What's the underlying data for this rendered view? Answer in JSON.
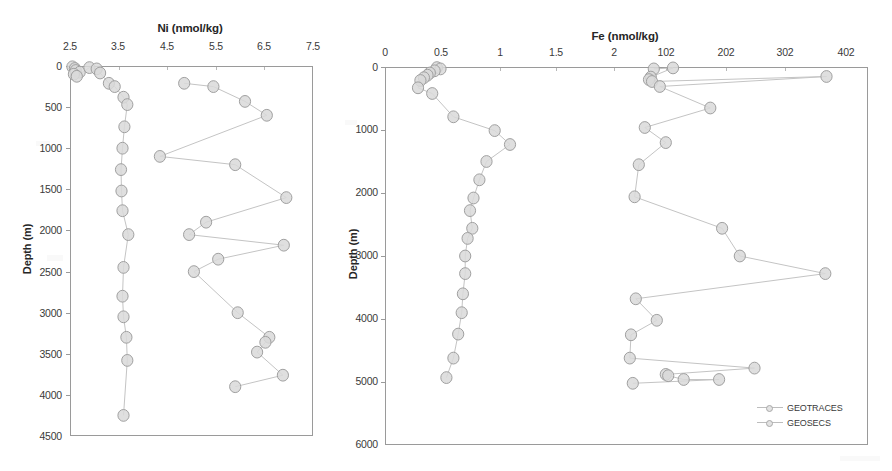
{
  "figure": {
    "background": "#ffffff",
    "marker_fill": "#d9d9d9",
    "marker_stroke": "#a0a0a0",
    "line_color": "#c4c4c4",
    "axis_color": "#9a9a9a"
  },
  "legend": {
    "position": "bottom-right-of-right-panel",
    "entries": [
      {
        "label": "GEOTRACES",
        "marker": "open-gray-circle"
      },
      {
        "label": "GEOSECS",
        "marker": "open-gray-circle"
      }
    ]
  },
  "chart_data": [
    {
      "type": "line",
      "panel": "left",
      "title": "Ni (nmol/kg)",
      "xlabel": "Ni (nmol/kg)",
      "ylabel": "Depth (m)",
      "xlim": [
        2.5,
        7.5
      ],
      "ylim": [
        0,
        4500
      ],
      "y_inverted": true,
      "grid": false,
      "xticks": [
        "2.5",
        "3.5",
        "4.5",
        "5.5",
        "6.5",
        "7.5"
      ],
      "xtick_values": [
        2.5,
        3.5,
        4.5,
        5.5,
        6.5,
        7.5
      ],
      "yticks": [
        "0",
        "500",
        "1000",
        "1500",
        "2000",
        "2500",
        "3000",
        "3500",
        "4000",
        "4500"
      ],
      "ytick_values": [
        0,
        500,
        1000,
        1500,
        2000,
        2500,
        3000,
        3500,
        4000,
        4500
      ],
      "series": [
        {
          "name": "GEOTRACES",
          "points": [
            [
              2.55,
              10
            ],
            [
              2.6,
              30
            ],
            [
              2.62,
              55
            ],
            [
              2.7,
              75
            ],
            [
              2.58,
              100
            ],
            [
              2.64,
              125
            ],
            [
              2.9,
              20
            ],
            [
              3.05,
              35
            ],
            [
              3.12,
              85
            ],
            [
              3.3,
              210
            ],
            [
              3.42,
              250
            ],
            [
              3.6,
              380
            ],
            [
              3.68,
              470
            ],
            [
              3.62,
              740
            ],
            [
              3.58,
              1000
            ],
            [
              3.55,
              1260
            ],
            [
              3.56,
              1520
            ],
            [
              3.58,
              1760
            ],
            [
              3.7,
              2050
            ],
            [
              3.6,
              2450
            ],
            [
              3.58,
              2800
            ],
            [
              3.6,
              3050
            ],
            [
              3.66,
              3300
            ],
            [
              3.68,
              3580
            ],
            [
              3.6,
              4250
            ]
          ]
        },
        {
          "name": "GEOSECS",
          "points": [
            [
              4.85,
              210
            ],
            [
              5.45,
              250
            ],
            [
              6.1,
              430
            ],
            [
              6.55,
              600
            ],
            [
              4.35,
              1100
            ],
            [
              5.9,
              1200
            ],
            [
              6.95,
              1600
            ],
            [
              5.3,
              1900
            ],
            [
              4.95,
              2050
            ],
            [
              6.9,
              2180
            ],
            [
              5.55,
              2350
            ],
            [
              5.05,
              2500
            ],
            [
              5.95,
              3000
            ],
            [
              6.6,
              3300
            ],
            [
              6.52,
              3360
            ],
            [
              6.35,
              3480
            ],
            [
              6.88,
              3760
            ],
            [
              5.9,
              3900
            ]
          ]
        }
      ]
    },
    {
      "type": "line",
      "panel": "right",
      "title": "Fe (nmol/kg)",
      "xlabel": "Fe (nmol/kg)",
      "ylabel": "Depth (m)",
      "x_axis_note": "split/broken axis: lower labels 0-2 then 102, 202, 302, 402",
      "xticks": [
        "0",
        "0.5",
        "1",
        "1.5",
        "2",
        "102",
        "202",
        "302",
        "402"
      ],
      "xtick_values": [
        0,
        0.5,
        1,
        1.5,
        2,
        102,
        202,
        302,
        402
      ],
      "ylim": [
        0,
        6000
      ],
      "y_inverted": true,
      "grid": false,
      "yticks": [
        "0",
        "1000",
        "2000",
        "3000",
        "4000",
        "5000",
        "6000"
      ],
      "ytick_values": [
        0,
        1000,
        2000,
        3000,
        4000,
        5000,
        6000
      ],
      "series": [
        {
          "name": "GEOTRACES",
          "points": [
            [
              0.44,
              10
            ],
            [
              0.47,
              30
            ],
            [
              0.42,
              60
            ],
            [
              0.38,
              95
            ],
            [
              0.36,
              130
            ],
            [
              0.33,
              170
            ],
            [
              0.3,
              215
            ],
            [
              0.28,
              330
            ],
            [
              0.4,
              420
            ],
            [
              0.58,
              790
            ],
            [
              0.93,
              1010
            ],
            [
              1.06,
              1230
            ],
            [
              0.86,
              1500
            ],
            [
              0.8,
              1790
            ],
            [
              0.75,
              2080
            ],
            [
              0.72,
              2280
            ],
            [
              0.74,
              2560
            ],
            [
              0.7,
              2720
            ],
            [
              0.68,
              3000
            ],
            [
              0.68,
              3280
            ],
            [
              0.66,
              3600
            ],
            [
              0.65,
              3900
            ],
            [
              0.62,
              4240
            ],
            [
              0.58,
              4620
            ],
            [
              0.52,
              4930
            ]
          ]
        },
        {
          "name": "GEOSECS",
          "points": [
            [
              60,
              30
            ],
            [
              92,
              15
            ],
            [
              55,
              160
            ],
            [
              52,
              200
            ],
            [
              57,
              230
            ],
            [
              352,
              150
            ],
            [
              70,
              310
            ],
            [
              155,
              650
            ],
            [
              45,
              960
            ],
            [
              80,
              1200
            ],
            [
              35,
              1550
            ],
            [
              28,
              2060
            ],
            [
              175,
              2560
            ],
            [
              205,
              3000
            ],
            [
              350,
              3280
            ],
            [
              30,
              3680
            ],
            [
              65,
              4020
            ],
            [
              22,
              4250
            ],
            [
              20,
              4620
            ],
            [
              230,
              4780
            ],
            [
              80,
              4880
            ],
            [
              84,
              4900
            ],
            [
              110,
              4960
            ],
            [
              170,
              4960
            ],
            [
              25,
              5020
            ]
          ]
        }
      ]
    }
  ]
}
